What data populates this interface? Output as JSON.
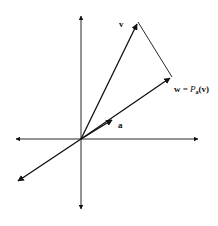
{
  "diagram": {
    "colors": {
      "ink": "#111111",
      "background": "#ffffff"
    },
    "origin": [
      81,
      139
    ],
    "axes": {
      "x_axis": {
        "from": [
          14,
          139
        ],
        "to": [
          200,
          139
        ],
        "arrows": "both"
      },
      "y_axis": {
        "from": [
          81,
          211
        ],
        "to": [
          81,
          14
        ],
        "arrows": "both"
      }
    },
    "vectors": {
      "v": {
        "tip": [
          138,
          22
        ],
        "label": "v"
      },
      "w": {
        "tip": [
          172,
          77
        ],
        "label_w": "w",
        "label_eq": "=",
        "label_P": "P",
        "label_sub": "a",
        "label_arg": "(v)"
      },
      "a": {
        "arrow_at": [
          110,
          121
        ],
        "label": "a"
      },
      "line_through_a_negative": {
        "tip": [
          16,
          182
        ]
      }
    },
    "perpendicular": {
      "from": [
        138,
        22
      ],
      "to": [
        172,
        77
      ]
    }
  }
}
